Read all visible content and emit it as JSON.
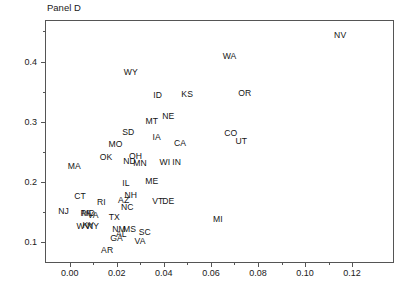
{
  "chart_data": {
    "type": "scatter",
    "title": "Panel D",
    "xlabel": "",
    "ylabel": "Change in High Sch. Grad. Rate, 1910–1928",
    "xlim": [
      -0.0105,
      0.1378
    ],
    "ylim": [
      0.0655,
      0.469
    ],
    "grid": false,
    "legend": null,
    "marker_style": "text-label-only",
    "xticks": [
      0.0,
      0.02,
      0.04,
      0.06,
      0.08,
      0.1,
      0.12
    ],
    "xticklabels": [
      "0.00",
      "0.02",
      "0.04",
      "0.06",
      "0.08",
      "0.10",
      "0.12"
    ],
    "xminorticks": [
      0.01,
      0.03,
      0.05,
      0.07,
      0.09,
      0.11
    ],
    "yticks": [
      0.1,
      0.2,
      0.3,
      0.4
    ],
    "yticklabels": [
      "0.1",
      "0.2",
      "0.3",
      "0.4"
    ],
    "yminorticks": [
      0.15,
      0.25,
      0.35,
      0.45
    ],
    "points": [
      {
        "label": "NV",
        "x": 0.1145,
        "y": 0.446
      },
      {
        "label": "WA",
        "x": 0.0675,
        "y": 0.4105
      },
      {
        "label": "WY",
        "x": 0.0255,
        "y": 0.385
      },
      {
        "label": "OR",
        "x": 0.074,
        "y": 0.349
      },
      {
        "label": "KS",
        "x": 0.0495,
        "y": 0.348
      },
      {
        "label": "ID",
        "x": 0.037,
        "y": 0.346
      },
      {
        "label": "NE",
        "x": 0.0415,
        "y": 0.311
      },
      {
        "label": "MT",
        "x": 0.0345,
        "y": 0.3035
      },
      {
        "label": "SD",
        "x": 0.0245,
        "y": 0.284
      },
      {
        "label": "CO",
        "x": 0.068,
        "y": 0.283
      },
      {
        "label": "IA",
        "x": 0.0365,
        "y": 0.277
      },
      {
        "label": "UT",
        "x": 0.0725,
        "y": 0.269
      },
      {
        "label": "CA",
        "x": 0.0465,
        "y": 0.2665
      },
      {
        "label": "MO",
        "x": 0.019,
        "y": 0.265
      },
      {
        "label": "OH",
        "x": 0.0275,
        "y": 0.2455
      },
      {
        "label": "OK",
        "x": 0.015,
        "y": 0.243
      },
      {
        "label": "ND",
        "x": 0.025,
        "y": 0.237
      },
      {
        "label": "MN",
        "x": 0.0295,
        "y": 0.234
      },
      {
        "label": "WI",
        "x": 0.04,
        "y": 0.2345
      },
      {
        "label": "IN",
        "x": 0.045,
        "y": 0.2345
      },
      {
        "label": "MA",
        "x": 0.0015,
        "y": 0.2275
      },
      {
        "label": "ME",
        "x": 0.0345,
        "y": 0.204
      },
      {
        "label": "IL",
        "x": 0.0235,
        "y": 0.1995
      },
      {
        "label": "NH",
        "x": 0.0255,
        "y": 0.18
      },
      {
        "label": "CT",
        "x": 0.004,
        "y": 0.1785
      },
      {
        "label": "AZ",
        "x": 0.0225,
        "y": 0.1715
      },
      {
        "label": "VT",
        "x": 0.037,
        "y": 0.1705
      },
      {
        "label": "DE",
        "x": 0.0415,
        "y": 0.1705
      },
      {
        "label": "RI",
        "x": 0.013,
        "y": 0.168
      },
      {
        "label": "NC",
        "x": 0.024,
        "y": 0.1605
      },
      {
        "label": "NJ",
        "x": -0.003,
        "y": 0.154
      },
      {
        "label": "PA",
        "x": 0.0065,
        "y": 0.15
      },
      {
        "label": "MD",
        "x": 0.0075,
        "y": 0.1495
      },
      {
        "label": "VA",
        "x": 0.0095,
        "y": 0.147
      },
      {
        "label": "TX",
        "x": 0.0185,
        "y": 0.1435
      },
      {
        "label": "MI",
        "x": 0.0625,
        "y": 0.14
      },
      {
        "label": "KY",
        "x": 0.0075,
        "y": 0.13
      },
      {
        "label": "NY",
        "x": 0.0095,
        "y": 0.1285
      },
      {
        "label": "WV",
        "x": 0.0055,
        "y": 0.128
      },
      {
        "label": "NM",
        "x": 0.0205,
        "y": 0.1235
      },
      {
        "label": "MS",
        "x": 0.025,
        "y": 0.1235
      },
      {
        "label": "AL",
        "x": 0.0215,
        "y": 0.116
      },
      {
        "label": "SC",
        "x": 0.0315,
        "y": 0.118
      },
      {
        "label": "GA",
        "x": 0.0195,
        "y": 0.108
      },
      {
        "label": "VA2",
        "x": 0.0295,
        "y": 0.104
      },
      {
        "label": "AR",
        "x": 0.0155,
        "y": 0.088
      }
    ]
  }
}
